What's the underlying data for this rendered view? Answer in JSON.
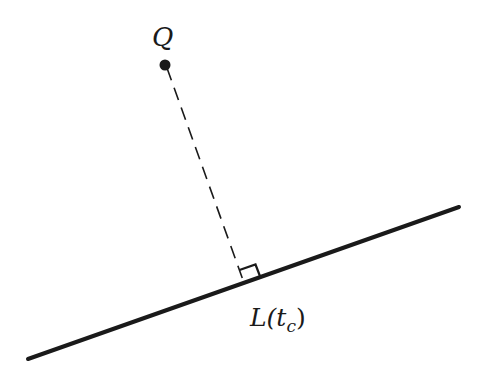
{
  "diagram": {
    "point": {
      "label": "Q",
      "x": 165,
      "y": 65
    },
    "line": {
      "x1": 28,
      "y1": 359,
      "x2": 459,
      "y2": 207
    },
    "foot": {
      "label_main": "L(t",
      "label_sub": "c",
      "label_close": ")",
      "x": 244,
      "y": 283
    },
    "colors": {
      "stroke": "#1a1a1a",
      "background": "#ffffff"
    }
  }
}
